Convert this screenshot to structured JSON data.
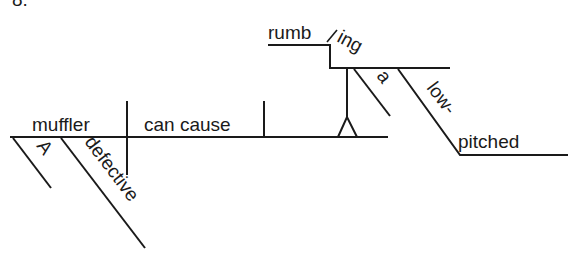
{
  "problem_number": "8.",
  "diagram": {
    "type": "sentence-diagram",
    "sentence_words": [
      "A",
      "defective",
      "muffler",
      "can cause",
      "a",
      "low-pitched",
      "rumbling"
    ],
    "subject": "muffler",
    "verb": "can cause",
    "direct_object_gerund": {
      "stem": "rumb",
      "suffix": "ing",
      "full": "rumbling"
    },
    "subject_modifiers": [
      "A",
      "defective"
    ],
    "object_modifiers": [
      "a",
      "low-pitched"
    ],
    "line_color": "#1a1a1a",
    "background_color": "#ffffff"
  }
}
